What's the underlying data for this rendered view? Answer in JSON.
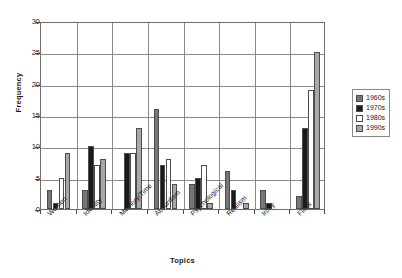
{
  "chart_data": {
    "type": "bar",
    "title": "",
    "xlabel": "Topics",
    "ylabel": "Frequency",
    "ylim": [
      0,
      30
    ],
    "yticks": [
      0,
      5,
      10,
      15,
      20,
      25,
      30
    ],
    "grid": true,
    "legend_position": "right",
    "categories": [
      "Women",
      "Identity",
      "Memory/Time",
      "Absurdism",
      "Psychological",
      "Realism",
      "Irony",
      "Films"
    ],
    "series": [
      {
        "name": "1960s",
        "color": "#767676",
        "values": [
          3,
          3,
          0,
          16,
          4,
          6,
          3,
          2
        ]
      },
      {
        "name": "1970s",
        "color": "#1a1a1a",
        "values": [
          1,
          10,
          9,
          7,
          5,
          3,
          1,
          13
        ]
      },
      {
        "name": "1980s",
        "color": "#ffffff",
        "values": [
          5,
          7,
          9,
          8,
          7,
          0,
          0,
          19
        ]
      },
      {
        "name": "1990s",
        "color": "#a8a8a8",
        "values": [
          9,
          8,
          13,
          4,
          1,
          1,
          0,
          25
        ]
      }
    ]
  },
  "legend": {
    "items": [
      {
        "label": "1960s",
        "color": "#767676"
      },
      {
        "label": "1970s",
        "color": "#1a1a1a"
      },
      {
        "label": "1980s",
        "color": "#ffffff"
      },
      {
        "label": "1990s",
        "color": "#a8a8a8"
      }
    ]
  },
  "axes": {
    "y_title": "Frequency",
    "x_title": "Topics",
    "y_tick_labels": [
      "0",
      "5",
      "10",
      "15",
      "20",
      "25",
      "30"
    ]
  }
}
